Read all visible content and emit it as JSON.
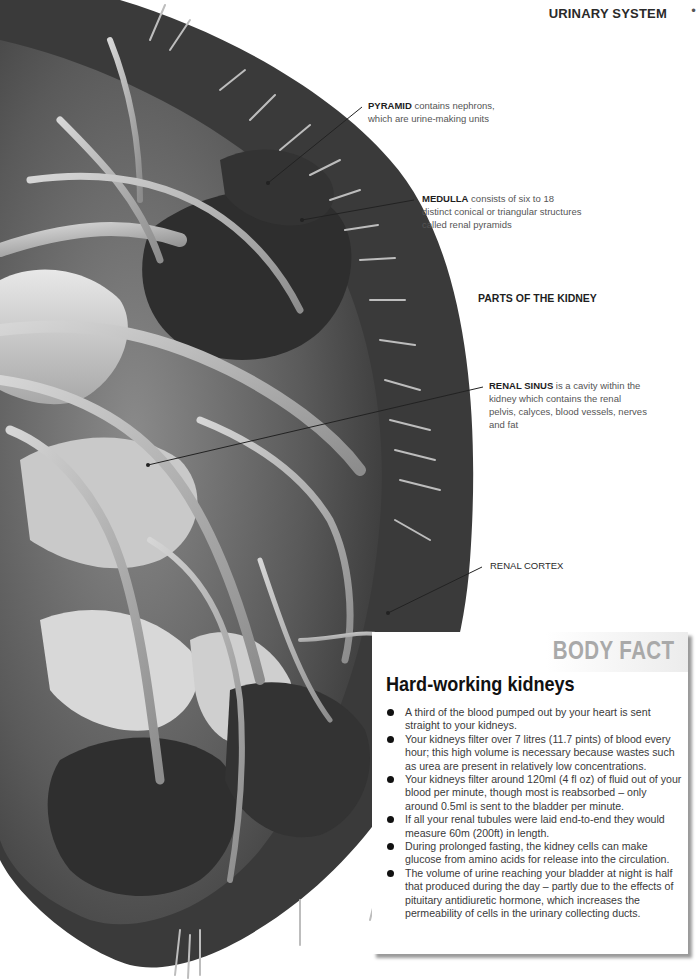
{
  "header": {
    "section_title": "URINARY SYSTEM",
    "page_mark": "•"
  },
  "labels": {
    "pyramid": {
      "term": "PYRAMID",
      "text": " contains nephrons, which are urine-making units"
    },
    "medulla": {
      "term": "MEDULLA",
      "text": " consists of six to 18 distinct conical or triangular structures called renal pyramids"
    },
    "parts_heading": "PARTS OF THE KIDNEY",
    "renal_sinus": {
      "term": "RENAL SINUS",
      "text": " is a cavity within the kidney which contains the renal pelvis, calyces, blood  vessels, nerves and fat"
    },
    "renal_cortex": {
      "term": "RENAL CORTEX",
      "text": ""
    }
  },
  "body_fact": {
    "kicker": "BODY FACT",
    "title": "Hard-working kidneys",
    "items": [
      "A third of the blood pumped out by your heart is sent straight to your kidneys.",
      "Your kidneys filter over 7 litres (11.7 pints) of blood every hour; this high volume is necessary because wastes such as urea are present in relatively low concentrations.",
      "Your kidneys filter around 120ml (4 fl oz) of fluid out of your blood per minute, though most is reabsorbed – only around 0.5ml is sent to the bladder per minute.",
      "If all your renal tubules were laid end-to-end they would measure 60m (200ft) in length.",
      "During prolonged fasting, the kidney cells can make glucose from amino acids for release into the circulation.",
      "The volume of urine reaching your bladder at night is half that produced during the day – partly due to the effects of pituitary antidiuretic hormone, which increases the permeability of cells in the urinary collecting ducts."
    ]
  },
  "colors": {
    "kidney_dark": "#3b3b3b",
    "kidney_mid": "#6e6e6e",
    "vessel_light": "#b5b5b5",
    "kicker_gray": "#a9a9a9",
    "title_black": "#111111"
  }
}
